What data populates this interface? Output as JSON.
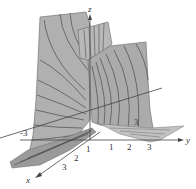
{
  "figure": {
    "type": "3d-surface-plot",
    "surface_color": "#a9a9a9",
    "surface_dark": "#8f8f8f",
    "surface_light": "#c4c4c4",
    "contour_color": "#3a3a3a",
    "axis_color": "#444444"
  },
  "axes": {
    "z_label": "z",
    "x_label": "x",
    "y_label": "y",
    "x_ticks": [
      "1",
      "2",
      "3"
    ],
    "y_ticks": [
      "-3",
      "1",
      "2",
      "3"
    ],
    "diagonal_tick": "3"
  }
}
